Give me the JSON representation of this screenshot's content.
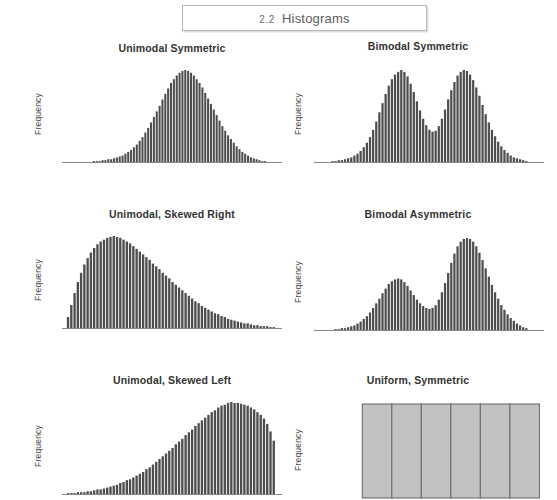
{
  "header": {
    "section_number": "2.2",
    "title": "Histograms"
  },
  "panels": [
    {
      "id": "unimodal-symmetric",
      "title": "Unimodal Symmetric",
      "ylabel": "Frequency"
    },
    {
      "id": "bimodal-symmetric",
      "title": "Bimodal Symmetric",
      "ylabel": "Frequency"
    },
    {
      "id": "unimodal-skewed-right",
      "title": "Unimodal, Skewed Right",
      "ylabel": "Frequency"
    },
    {
      "id": "bimodal-asymmetric",
      "title": "Bimodal Asymmetric",
      "ylabel": "Frequency"
    },
    {
      "id": "unimodal-skewed-left",
      "title": "Unimodal, Skewed Left",
      "ylabel": "Frequency"
    },
    {
      "id": "uniform-symmetric",
      "title": "Uniform, Symmetric",
      "ylabel": "Frequency"
    }
  ],
  "colors": {
    "bar_fill": "#4e4e4e",
    "uniform_bar_fill": "#c2c2c2",
    "uniform_bar_stroke": "#6e6e6e",
    "baseline": "#6b6b6b",
    "title_text": "#333333",
    "header_border": "#b8b8b8",
    "background": "#ffffff"
  },
  "chart_data": [
    {
      "type": "bar",
      "id": "unimodal-symmetric",
      "title": "Unimodal Symmetric",
      "xlabel": "",
      "ylabel": "Frequency",
      "grid": false,
      "legend": null,
      "ylim": [
        0,
        100
      ],
      "shape": "normal",
      "n_bins": 64,
      "bar_start_frac": 0.1,
      "bar_end_frac": 0.93,
      "values": [
        0,
        0,
        0,
        1,
        1,
        1,
        2,
        2,
        3,
        3,
        4,
        5,
        6,
        7,
        9,
        11,
        13,
        16,
        19,
        23,
        27,
        32,
        37,
        43,
        49,
        55,
        61,
        68,
        74,
        80,
        86,
        90,
        94,
        97,
        99,
        100,
        99,
        97,
        94,
        90,
        86,
        81,
        75,
        69,
        63,
        57,
        51,
        45,
        39,
        34,
        29,
        25,
        21,
        17,
        14,
        11,
        9,
        7,
        5,
        4,
        3,
        2,
        1,
        1
      ]
    },
    {
      "type": "bar",
      "id": "bimodal-symmetric",
      "title": "Bimodal Symmetric",
      "xlabel": "",
      "ylabel": "Frequency",
      "grid": false,
      "legend": null,
      "ylim": [
        0,
        100
      ],
      "shape": "bimodal-equal",
      "n_bins": 64,
      "bar_start_frac": 0.06,
      "bar_end_frac": 0.93,
      "values": [
        0,
        1,
        1,
        2,
        2,
        3,
        4,
        5,
        7,
        9,
        12,
        16,
        21,
        27,
        35,
        44,
        54,
        64,
        74,
        83,
        90,
        95,
        98,
        100,
        98,
        93,
        85,
        76,
        66,
        56,
        47,
        40,
        35,
        33,
        34,
        39,
        47,
        57,
        68,
        78,
        87,
        94,
        98,
        100,
        99,
        95,
        89,
        81,
        72,
        62,
        52,
        43,
        35,
        28,
        22,
        17,
        13,
        10,
        7,
        5,
        4,
        3,
        2,
        1
      ]
    },
    {
      "type": "bar",
      "id": "unimodal-skewed-right",
      "title": "Unimodal, Skewed Right",
      "xlabel": "",
      "ylabel": "Frequency",
      "grid": false,
      "legend": null,
      "ylim": [
        0,
        100
      ],
      "shape": "right-skewed",
      "n_bins": 64,
      "bar_start_frac": 0.02,
      "bar_end_frac": 0.97,
      "values": [
        12,
        25,
        38,
        50,
        60,
        69,
        76,
        82,
        87,
        91,
        94,
        96,
        98,
        99,
        100,
        99,
        98,
        96,
        94,
        92,
        89,
        86,
        83,
        80,
        77,
        74,
        70,
        67,
        64,
        60,
        57,
        54,
        50,
        47,
        44,
        41,
        38,
        35,
        32,
        29,
        27,
        24,
        22,
        20,
        18,
        16,
        15,
        13,
        12,
        10,
        9,
        8,
        7,
        6,
        5,
        5,
        4,
        3,
        3,
        2,
        2,
        2,
        1,
        1
      ]
    },
    {
      "type": "bar",
      "id": "bimodal-asymmetric",
      "title": "Bimodal Asymmetric",
      "xlabel": "",
      "ylabel": "Frequency",
      "grid": false,
      "legend": null,
      "ylim": [
        0,
        100
      ],
      "shape": "bimodal-unequal",
      "n_bins": 64,
      "bar_start_frac": 0.06,
      "bar_end_frac": 0.93,
      "values": [
        0,
        0,
        1,
        1,
        2,
        2,
        3,
        4,
        5,
        7,
        9,
        12,
        15,
        19,
        24,
        29,
        34,
        40,
        45,
        50,
        53,
        55,
        56,
        55,
        52,
        48,
        43,
        38,
        33,
        29,
        26,
        24,
        23,
        24,
        27,
        33,
        41,
        51,
        62,
        73,
        83,
        91,
        96,
        99,
        100,
        99,
        96,
        91,
        84,
        76,
        67,
        58,
        49,
        41,
        34,
        27,
        22,
        17,
        13,
        10,
        7,
        5,
        3,
        2
      ]
    },
    {
      "type": "bar",
      "id": "unimodal-skewed-left",
      "title": "Unimodal, Skewed Left",
      "xlabel": "",
      "ylabel": "Frequency",
      "grid": false,
      "legend": null,
      "ylim": [
        0,
        100
      ],
      "shape": "left-skewed",
      "n_bins": 64,
      "bar_start_frac": 0.02,
      "bar_end_frac": 0.97,
      "values": [
        1,
        1,
        1,
        2,
        2,
        2,
        3,
        3,
        4,
        5,
        5,
        6,
        7,
        8,
        9,
        10,
        12,
        13,
        15,
        16,
        18,
        20,
        22,
        24,
        27,
        29,
        32,
        35,
        38,
        41,
        44,
        47,
        50,
        54,
        57,
        60,
        64,
        67,
        70,
        74,
        77,
        80,
        83,
        86,
        89,
        91,
        94,
        96,
        97,
        99,
        100,
        99,
        99,
        98,
        97,
        96,
        94,
        92,
        89,
        86,
        82,
        76,
        68,
        58
      ]
    },
    {
      "type": "bar",
      "id": "uniform-symmetric",
      "title": "Uniform, Symmetric",
      "xlabel": "",
      "ylabel": "Frequency",
      "grid": false,
      "legend": null,
      "ylim": [
        0,
        100
      ],
      "shape": "uniform",
      "n_bins": 6,
      "bar_start_frac": 0.21,
      "bar_end_frac": 0.98,
      "values": [
        100,
        100,
        100,
        100,
        100,
        100
      ]
    }
  ]
}
